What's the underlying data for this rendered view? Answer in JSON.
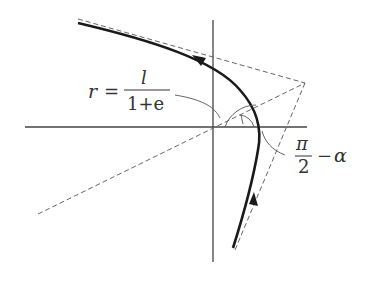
{
  "diagram": {
    "type": "hyperbolic-orbit",
    "colors": {
      "axis": "#444444",
      "curve": "#1a1a1a",
      "dashed": "#666666",
      "arc": "#555555",
      "label": "#333333"
    },
    "labels": {
      "r_lhs": "r",
      "equals": "=",
      "numerator": "l",
      "denominator": "1+e",
      "angle_numerator": "π",
      "angle_denominator": "2",
      "angle_minus": "−",
      "angle_alpha": "α"
    }
  }
}
